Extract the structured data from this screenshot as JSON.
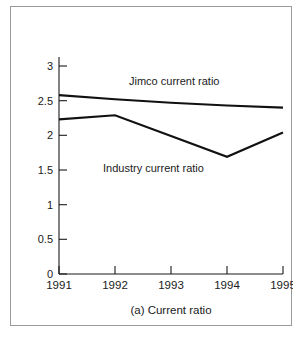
{
  "figure": {
    "caption": "(a) Current ratio",
    "frame_color": "#9a9a9a",
    "line_color": "#111111",
    "background": "#ffffff"
  },
  "chart_data": {
    "type": "line",
    "title": "",
    "subtitle": "",
    "caption": "(a) Current ratio",
    "xlabel": "",
    "ylabel": "",
    "x": [
      "1991",
      "1992",
      "1993",
      "1994",
      "1995"
    ],
    "categories": [
      "1991",
      "1992",
      "1993",
      "1994",
      "1995"
    ],
    "xtick_labels": [
      "1991",
      "1992",
      "1993",
      "1994",
      "1995"
    ],
    "ytick_labels": [
      "0",
      "0.5",
      "1",
      "1.5",
      "2",
      "2.5",
      "3"
    ],
    "ytick_values": [
      0,
      0.5,
      1,
      1.5,
      2,
      2.5,
      3
    ],
    "ylim": [
      0,
      3.25
    ],
    "xlim": [
      "1991",
      "1995"
    ],
    "grid": false,
    "legend": "inline-annotations",
    "series": [
      {
        "name": "Jimco current ratio",
        "label": "Jimco current ratio",
        "values": [
          2.58,
          2.52,
          2.47,
          2.43,
          2.4
        ],
        "annotation": {
          "text": "Jimco current ratio",
          "x_year": "1992.6",
          "y_value": 2.72
        }
      },
      {
        "name": "Industry current ratio",
        "label": "Industry current ratio",
        "values": [
          2.23,
          2.29,
          1.99,
          1.69,
          2.04
        ],
        "annotation": {
          "text": "Industry current ratio",
          "x_year": "1992.1",
          "y_value": 1.55
        }
      }
    ]
  }
}
